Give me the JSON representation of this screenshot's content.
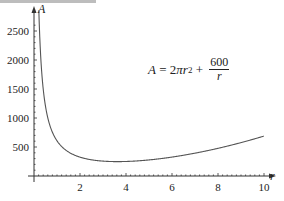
{
  "chart_data": {
    "type": "line",
    "title": "",
    "xlabel": "r",
    "ylabel": "A",
    "annotation": {
      "lhs": "A",
      "eq": " = 2",
      "pi": "π",
      "r": "r",
      "exp": "2",
      "plus": " + ",
      "numerator": "600",
      "denominator": "r"
    },
    "x_ticks": [
      "2",
      "4",
      "6",
      "8",
      "10"
    ],
    "y_ticks": [
      "500",
      "1000",
      "1500",
      "2000",
      "2500"
    ],
    "xlim": [
      0,
      10.5
    ],
    "ylim": [
      0,
      2650
    ],
    "grid": false,
    "series": [
      {
        "name": "A = 2πr² + 600/r",
        "x": [
          0.22,
          0.3,
          0.5,
          0.75,
          1,
          1.5,
          2,
          2.5,
          3,
          3.5,
          4,
          5,
          6,
          7,
          8,
          9,
          10
        ],
        "values": [
          2727,
          2001,
          1202,
          804,
          606,
          414,
          325,
          279,
          257,
          250,
          251,
          277,
          326,
          394,
          477,
          576,
          688
        ]
      }
    ],
    "color": "#555555"
  }
}
